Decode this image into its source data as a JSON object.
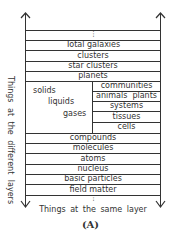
{
  "diagram": {
    "top_dots": "⋮",
    "rows_top": [
      {
        "label": "Total galaxies"
      },
      {
        "label": "clusters"
      },
      {
        "label": "star clusters"
      },
      {
        "label": "planets"
      }
    ],
    "states_of_matter": [
      "solids",
      "liquids",
      "gases"
    ],
    "biological_levels": [
      {
        "label": "communities"
      },
      {
        "label": "animals  plants"
      },
      {
        "label": "systems"
      },
      {
        "label": "tissues"
      },
      {
        "label": "cells"
      }
    ],
    "rows_bottom": [
      {
        "label": "compounds"
      },
      {
        "label": "molecules"
      },
      {
        "label": "atoms"
      },
      {
        "label": "nucleus"
      },
      {
        "label": "basic particles"
      },
      {
        "label": "field matter"
      }
    ],
    "bottom_dots": "⋮",
    "vertical_axis_label": "Things at the different layers",
    "horizontal_axis_label": "Things at the same layer",
    "caption": "(A)",
    "arrows": {
      "left": "up-down",
      "right": "up-down"
    },
    "line_color": "#333333"
  }
}
